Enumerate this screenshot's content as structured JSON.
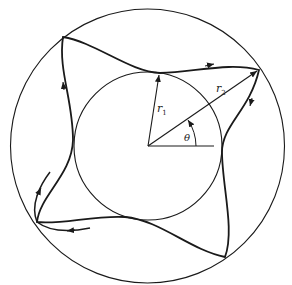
{
  "figure": {
    "type": "orbit-diagram",
    "labels": {
      "r1": "r",
      "r1_sub": "1",
      "r2": "r",
      "r2_sub": "2",
      "theta": "θ"
    },
    "colors": {
      "stroke": "#1a1a1a",
      "background": "#ffffff"
    },
    "lobes": 4,
    "direction": "clockwise"
  }
}
